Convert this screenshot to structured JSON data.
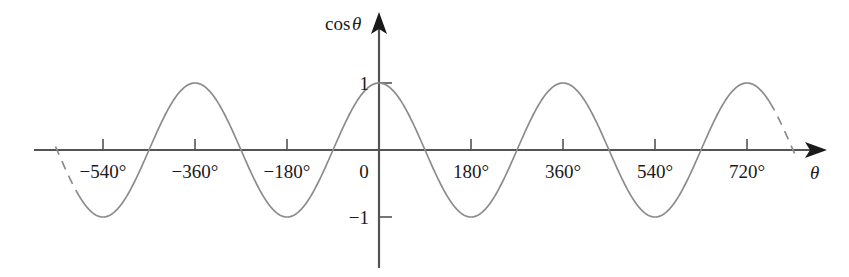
{
  "figure": {
    "name": "cosine-graph",
    "background_color": "#ffffff",
    "curve_color": "#8c8c8c",
    "axis_color": "#545454",
    "text_color": "#1a1a1a"
  },
  "labels": {
    "y_axis_title_fn": "cos",
    "y_axis_title_var": "θ",
    "x_axis_title": "θ",
    "origin": "0",
    "y_top": "1",
    "y_bottom": "−1"
  },
  "chart_data": {
    "type": "line",
    "title": "",
    "subtitle": "",
    "xlabel": "θ",
    "ylabel": "cos θ",
    "function": "y = cos(θ)",
    "grid": false,
    "legend": null,
    "xlim": [
      -630,
      810
    ],
    "ylim": [
      -1.35,
      1.35
    ],
    "x_unit": "degrees",
    "x_tick_values": [
      -540,
      -360,
      -180,
      0,
      180,
      360,
      540,
      720
    ],
    "x_tick_labels": [
      "−540°",
      "−360°",
      "−180°",
      "0",
      "180°",
      "360°",
      "540°",
      "720°"
    ],
    "y_tick_values": [
      1,
      -1
    ],
    "y_tick_labels": [
      "1",
      "−1"
    ],
    "amplitude": 1,
    "period_degrees": 360,
    "solid_domain_degrees": [
      -585,
      765
    ],
    "dashed_domain_degrees": [
      [
        -633,
        -585
      ],
      [
        765,
        813
      ]
    ],
    "maxima_degrees": [
      -360,
      0,
      360,
      720
    ],
    "minima_degrees": [
      -540,
      -180,
      180,
      540
    ],
    "zeros_degrees": [
      -630,
      -450,
      -270,
      -90,
      90,
      270,
      450,
      630,
      810
    ],
    "x": [
      -630,
      -600,
      -570,
      -540,
      -510,
      -480,
      -450,
      -420,
      -390,
      -360,
      -330,
      -300,
      -270,
      -240,
      -210,
      -180,
      -150,
      -120,
      -90,
      -60,
      -30,
      0,
      30,
      60,
      90,
      120,
      150,
      180,
      210,
      240,
      270,
      300,
      330,
      360,
      390,
      420,
      450,
      480,
      510,
      540,
      570,
      600,
      630,
      660,
      690,
      720,
      750,
      780,
      810
    ],
    "y": [
      0,
      -0.5,
      -0.866,
      -1,
      -0.866,
      -0.5,
      0,
      0.5,
      0.866,
      1,
      0.866,
      0.5,
      0,
      -0.5,
      -0.866,
      -1,
      -0.866,
      -0.5,
      0,
      0.5,
      0.866,
      1,
      0.866,
      0.5,
      0,
      -0.5,
      -0.866,
      -1,
      -0.866,
      -0.5,
      0,
      0.5,
      0.866,
      1,
      0.866,
      0.5,
      0,
      -0.5,
      -0.866,
      -1,
      -0.866,
      -0.5,
      0,
      0.5,
      0.866,
      1,
      0.866,
      0.5,
      0
    ]
  }
}
